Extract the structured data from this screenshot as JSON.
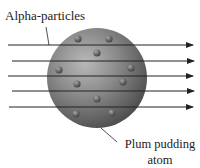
{
  "labels": {
    "alpha_particles": "Alpha-particles",
    "atom_line1": "Plum pudding",
    "atom_line2": "atom"
  },
  "atom": {
    "center": [
      97,
      78
    ],
    "radius": 50,
    "color": "#7a7a7a",
    "electrons": [
      [
        78,
        39
      ],
      [
        109,
        39
      ],
      [
        97,
        53
      ],
      [
        59,
        70
      ],
      [
        131,
        68
      ],
      [
        77,
        84
      ],
      [
        123,
        82
      ],
      [
        97,
        99
      ],
      [
        76,
        114
      ],
      [
        112,
        113
      ]
    ]
  },
  "alpha_rays": [
    {
      "y": 45,
      "x_start": 8,
      "x_end": 193
    },
    {
      "y": 61,
      "x_start": 12,
      "x_end": 194
    },
    {
      "y": 76,
      "x_start": 8,
      "x_end": 193
    },
    {
      "y": 91,
      "x_start": 12,
      "x_end": 194
    },
    {
      "y": 107,
      "x_start": 9,
      "x_end": 193
    }
  ],
  "colors": {
    "line": "#222222",
    "sphere_light": "#b0b0b0",
    "sphere_dark": "#4a4a4a"
  }
}
